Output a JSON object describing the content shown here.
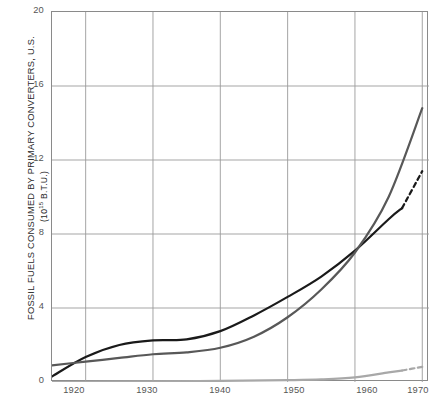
{
  "chart_data": {
    "type": "line",
    "title": "",
    "xlabel": "",
    "ylabel": "FOSSIL FUELS CONSUMED BY PRIMARY CONVERTERS, U.S.",
    "ylabel_units": "(10",
    "ylabel_units_exp": "15",
    "ylabel_units_tail": " B.T.U.)",
    "ylabel_full": "FOSSIL FUELS CONSUMED BY PRIMARY CONVERTERS, U.S. (10^15 B.T.U.)",
    "xlim": [
      1915,
      1971
    ],
    "ylim": [
      0,
      20
    ],
    "grid": true,
    "legend": "none",
    "xticks": [
      1920,
      1930,
      1940,
      1950,
      1960,
      1970
    ],
    "xtick_labels": [
      "1920",
      "1930",
      "1940",
      "1950",
      "1960",
      "1970"
    ],
    "yticks": [
      0,
      4,
      8,
      12,
      16,
      20
    ],
    "ytick_labels": [
      "0",
      "4",
      "8",
      "12",
      "16",
      "20"
    ],
    "series": [
      {
        "name": "coal",
        "color": "#1a1a1a",
        "style": "solid-then-dashed",
        "dash_from_x": 1967,
        "x": [
          1915,
          1920,
          1925,
          1930,
          1935,
          1940,
          1945,
          1950,
          1955,
          1960,
          1965,
          1967,
          1970
        ],
        "values": [
          0.3,
          1.35,
          2.0,
          2.25,
          2.3,
          2.75,
          3.6,
          4.6,
          5.7,
          7.1,
          8.8,
          9.4,
          11.4
        ]
      },
      {
        "name": "petroleum-and-natural-gas",
        "color": "#585858",
        "style": "solid",
        "x": [
          1915,
          1920,
          1925,
          1930,
          1935,
          1940,
          1945,
          1950,
          1955,
          1960,
          1965,
          1970
        ],
        "values": [
          0.9,
          1.1,
          1.3,
          1.5,
          1.6,
          1.85,
          2.45,
          3.5,
          5.0,
          7.0,
          10.0,
          14.8
        ]
      },
      {
        "name": "other",
        "color": "#a8a8a8",
        "style": "solid-then-dashed",
        "dash_from_x": 1967,
        "x": [
          1915,
          1930,
          1940,
          1950,
          1955,
          1960,
          1965,
          1967,
          1970
        ],
        "values": [
          0.0,
          0.03,
          0.06,
          0.1,
          0.14,
          0.25,
          0.52,
          0.62,
          0.82
        ]
      }
    ]
  }
}
